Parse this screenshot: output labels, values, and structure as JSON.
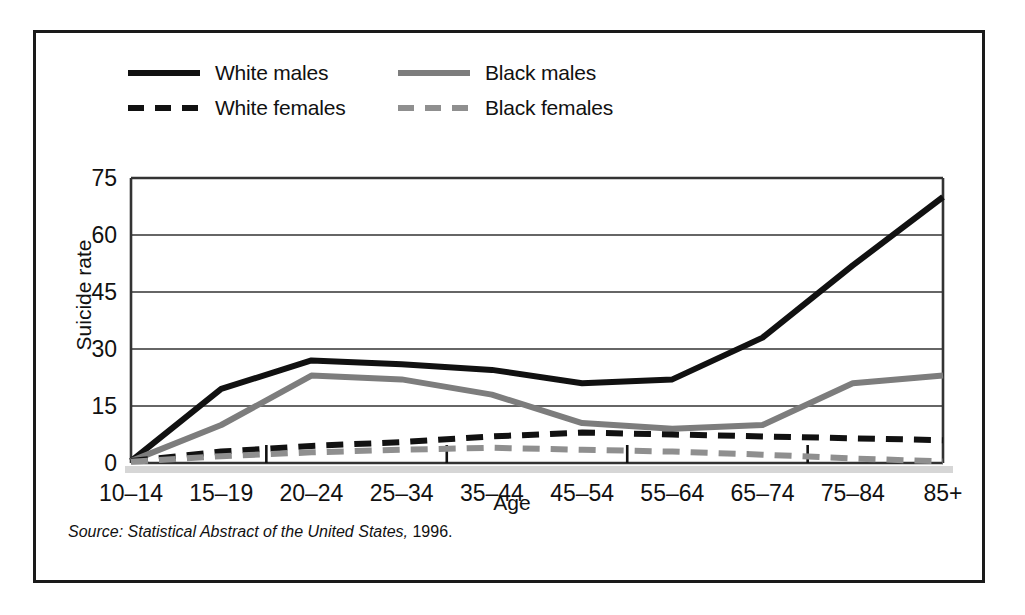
{
  "figure": {
    "border_color": "#1a1a1a"
  },
  "legend": {
    "position": "top-left",
    "items": [
      {
        "label": "White males",
        "style": "solid",
        "color": "#111111",
        "swatch": "solid-black"
      },
      {
        "label": "Black males",
        "style": "solid",
        "color": "#7d7d7d",
        "swatch": "solid-gray"
      },
      {
        "label": "White females",
        "style": "dashed",
        "color": "#111111",
        "swatch": "dash-black"
      },
      {
        "label": "Black females",
        "style": "dashed",
        "color": "#8f8f8f",
        "swatch": "dash-gray"
      }
    ]
  },
  "source": {
    "prefix": "Source: Statistical Abstract of the United States,",
    "suffix": " 1996."
  },
  "chart_data": {
    "type": "line",
    "title": "",
    "xlabel": "Age",
    "ylabel": "Suicide rate",
    "categories": [
      "10–14",
      "15–19",
      "20–24",
      "25–34",
      "35–44",
      "45–54",
      "55–64",
      "65–74",
      "75–84",
      "85+"
    ],
    "ylim": [
      0,
      75
    ],
    "yticks": [
      0,
      15,
      30,
      45,
      60,
      75
    ],
    "ytick_labels": [
      "0",
      "15",
      "30",
      "45",
      "60",
      "75"
    ],
    "grid": "horizontal",
    "legend_position": "above-plot-left",
    "series": [
      {
        "name": "White males",
        "color": "#111111",
        "style": "solid",
        "width": 6,
        "values": [
          0.5,
          19.5,
          27.0,
          26.0,
          24.5,
          21.0,
          22.0,
          33.0,
          52.0,
          70.0
        ]
      },
      {
        "name": "Black males",
        "color": "#7d7d7d",
        "style": "solid",
        "width": 6,
        "values": [
          0.5,
          10.0,
          23.0,
          22.0,
          18.0,
          10.5,
          9.0,
          10.0,
          21.0,
          23.0
        ]
      },
      {
        "name": "White females",
        "color": "#111111",
        "style": "dashed",
        "width": 6,
        "values": [
          0.5,
          3.0,
          4.5,
          5.5,
          7.0,
          8.0,
          7.5,
          7.0,
          6.5,
          6.0
        ]
      },
      {
        "name": "Black females",
        "color": "#8f8f8f",
        "style": "dashed",
        "width": 6,
        "values": [
          0.3,
          1.8,
          2.8,
          3.5,
          4.0,
          3.5,
          3.0,
          2.2,
          1.2,
          0.4
        ]
      }
    ]
  }
}
